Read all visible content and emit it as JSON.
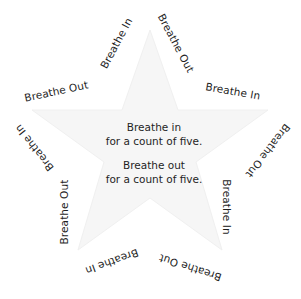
{
  "colors": {
    "background": "#ffffff",
    "text": "#1f1f1f",
    "star_fill": "#f7f7f7"
  },
  "center": {
    "inhale": {
      "line1": "Breathe in",
      "line2": "for a count of five."
    },
    "exhale": {
      "line1": "Breathe out",
      "line2": "for a count of five."
    }
  },
  "star_labels": [
    {
      "text": "Breathe Out",
      "cx": 56,
      "cy": 91,
      "rotate": -12
    },
    {
      "text": "Breathe In",
      "cx": 116,
      "cy": 43,
      "rotate": -62
    },
    {
      "text": "Breathe Out",
      "cx": 176,
      "cy": 43,
      "rotate": 62
    },
    {
      "text": "Breathe In",
      "cx": 233,
      "cy": 91,
      "rotate": 10
    },
    {
      "text": "Breathe Out",
      "cx": 268,
      "cy": 151,
      "rotate": 128
    },
    {
      "text": "Breathe In",
      "cx": 227,
      "cy": 207,
      "rotate": 90
    },
    {
      "text": "Breathe Out",
      "cx": 190,
      "cy": 268,
      "rotate": 198
    },
    {
      "text": "Breathe In",
      "cx": 112,
      "cy": 262,
      "rotate": 160
    },
    {
      "text": "Breathe Out",
      "cx": 64,
      "cy": 212,
      "rotate": -90
    },
    {
      "text": "Breathe In",
      "cx": 34,
      "cy": 148,
      "rotate": -128
    }
  ]
}
